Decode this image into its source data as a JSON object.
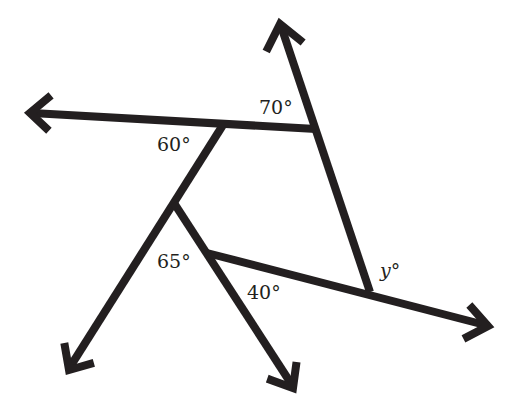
{
  "diagram": {
    "type": "geometry-angle-figure",
    "stroke_color": "#231f20",
    "background": "#ffffff",
    "labels": {
      "angle_70": "70°",
      "angle_60": "60°",
      "angle_65": "65°",
      "angle_40": "40°",
      "angle_y_var": "y",
      "angle_y_deg": "°"
    },
    "rays": [
      {
        "name": "top-ray",
        "from": [
          370,
          292
        ],
        "to": [
          280,
          22
        ]
      },
      {
        "name": "left-ray",
        "from": [
          316,
          129
        ],
        "to": [
          28,
          113
        ]
      },
      {
        "name": "bottom-left-ray",
        "from": [
          222,
          125
        ],
        "to": [
          68,
          370
        ]
      },
      {
        "name": "bottom-ray",
        "from": [
          175,
          205
        ],
        "to": [
          293,
          388
        ]
      },
      {
        "name": "right-ray",
        "from": [
          207,
          253
        ],
        "to": [
          488,
          326
        ]
      }
    ]
  }
}
